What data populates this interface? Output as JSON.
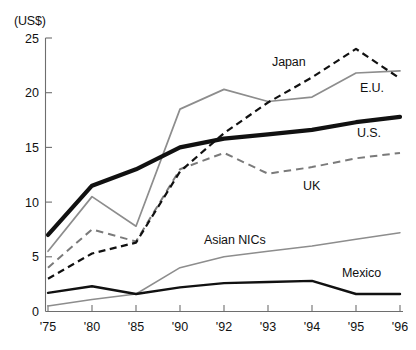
{
  "chart_data": {
    "type": "line",
    "title": "",
    "subtitle": "",
    "unit_label": "(US$)",
    "xlabel": "",
    "ylabel": "",
    "x": [
      "'75",
      "'80",
      "'85",
      "'90",
      "'92",
      "'93",
      "'94",
      "'95",
      "'96"
    ],
    "xtick_labels": [
      "'75",
      "'80",
      "'85",
      "'90",
      "'92",
      "'93",
      "'94",
      "'95",
      "'96"
    ],
    "ytick_labels": [
      "0",
      "5",
      "10",
      "15",
      "20",
      "25"
    ],
    "ytick_values": [
      0,
      5,
      10,
      15,
      20,
      25
    ],
    "ylim": [
      0,
      25
    ],
    "grid": false,
    "legend_position": "inline-right",
    "series": [
      {
        "name": "Japan",
        "label": "Japan",
        "style": "dashed",
        "color": "#111111",
        "width": "medium",
        "values": [
          3.0,
          5.3,
          6.3,
          12.8,
          16.3,
          19.1,
          21.4,
          24.0,
          21.3
        ]
      },
      {
        "name": "E.U.",
        "label": "E.U.",
        "style": "solid",
        "color": "#8d8d8d",
        "width": "thin",
        "values": [
          5.5,
          10.5,
          7.8,
          18.5,
          20.3,
          19.2,
          19.6,
          21.8,
          22.0
        ]
      },
      {
        "name": "U.S.",
        "label": "U.S.",
        "style": "solid",
        "color": "#111111",
        "width": "thick",
        "values": [
          7.0,
          11.5,
          13.0,
          15.0,
          15.8,
          16.2,
          16.6,
          17.3,
          17.8
        ]
      },
      {
        "name": "UK",
        "label": "UK",
        "style": "dashed",
        "color": "#7a7a7a",
        "width": "medium",
        "values": [
          4.0,
          7.5,
          6.4,
          13.0,
          14.5,
          12.6,
          13.2,
          14.0,
          14.5
        ]
      },
      {
        "name": "Asian NICs",
        "label": "Asian NICs",
        "label_head": "Asian ",
        "label_tail": "NIC",
        "label_tail2": "s",
        "style": "solid",
        "color": "#8d8d8d",
        "width": "thin",
        "values": [
          0.5,
          1.1,
          1.6,
          4.0,
          5.0,
          5.5,
          6.0,
          6.6,
          7.2
        ]
      },
      {
        "name": "Mexico",
        "label": "Mexico",
        "style": "solid",
        "color": "#111111",
        "width": "medium",
        "values": [
          1.7,
          2.3,
          1.6,
          2.2,
          2.6,
          2.7,
          2.8,
          1.6,
          1.6
        ]
      }
    ]
  },
  "labels": {
    "japan": "Japan",
    "eu": "E.U.",
    "us": "U.S.",
    "uk": "UK",
    "nics_head": "Asian ",
    "nics_tail": "NIC",
    "nics_tail2": "s",
    "mexico": "Mexico"
  },
  "ticks": {
    "y": [
      "25",
      "20",
      "15",
      "10",
      "5",
      "0"
    ],
    "x": [
      "'75",
      "'80",
      "'85",
      "'90",
      "'92",
      "'93",
      "'94",
      "'95",
      "'96"
    ]
  },
  "unit": "(US$)"
}
